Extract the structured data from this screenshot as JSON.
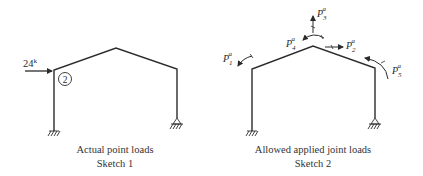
{
  "colors": {
    "line": "#2b2b2b",
    "background": "#ffffff"
  },
  "sketch1": {
    "caption_line1": "Actual point loads",
    "caption_line2": "Sketch 1",
    "load_label": "24",
    "load_unit": "k",
    "joint_number": "2"
  },
  "sketch2": {
    "caption_line1": "Allowed applied joint loads",
    "caption_line2": "Sketch 2",
    "loads": [
      {
        "symbol": "P",
        "sub": "1",
        "sup": "a"
      },
      {
        "symbol": "P",
        "sub": "2",
        "sup": "a"
      },
      {
        "symbol": "P",
        "sub": "3",
        "sup": "a"
      },
      {
        "symbol": "P",
        "sub": "4",
        "sup": "a"
      },
      {
        "symbol": "P",
        "sub": "5",
        "sup": "a"
      }
    ]
  }
}
